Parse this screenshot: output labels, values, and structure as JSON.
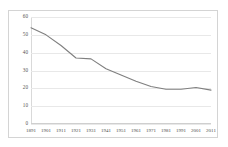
{
  "chart_data": {
    "type": "line",
    "title": "",
    "subtitle": "",
    "xlabel": "",
    "ylabel": "",
    "grid": true,
    "legend": false,
    "legend_position": "none",
    "line_color": "#7f7f7f",
    "gridline_color": "#e8e8e8",
    "border_color": "#d4d4d4",
    "x": [
      1891,
      1901,
      1911,
      1921,
      1931,
      1941,
      1951,
      1961,
      1971,
      1981,
      1991,
      2001,
      2011
    ],
    "categories": [
      "1891",
      "1901",
      "1911",
      "1921",
      "1931",
      "1941",
      "1951",
      "1961",
      "1971",
      "1981",
      "1991",
      "2001",
      "2011"
    ],
    "values": [
      54,
      50,
      44,
      37,
      36.5,
      31,
      27.5,
      24,
      21,
      19.5,
      19.5,
      20.5,
      19
    ],
    "series": [
      {
        "name": "",
        "values": [
          54,
          50,
          44,
          37,
          36.5,
          31,
          27.5,
          24,
          21,
          19.5,
          19.5,
          20.5,
          19
        ]
      }
    ],
    "ylim": [
      0,
      60
    ],
    "xlim": [
      1891,
      2011
    ],
    "yticks": [
      0,
      10,
      20,
      30,
      40,
      50,
      60
    ],
    "ytick_labels": [
      "0",
      "10",
      "20",
      "30",
      "40",
      "50",
      "60"
    ],
    "xtick_labels": [
      "1891",
      "1901",
      "1911",
      "1921",
      "1931",
      "1941",
      "1951",
      "1961",
      "1971",
      "1981",
      "1991",
      "2001",
      "2011"
    ]
  }
}
